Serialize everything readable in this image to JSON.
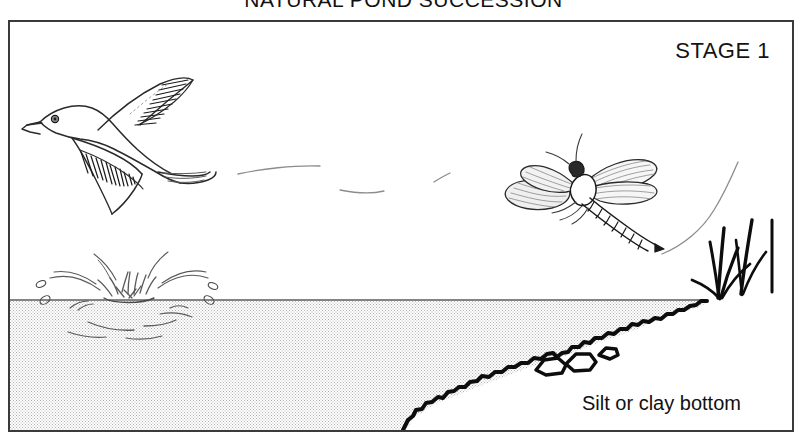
{
  "figure": {
    "title": "NATURAL POND  SUCCESSION",
    "stage_label": "STAGE 1",
    "bottom_label": "Silt or clay bottom"
  },
  "colors": {
    "frame_border": "#3a3a3a",
    "ink": "#111111",
    "line_gray": "#6d6d6d",
    "water_stipple": "#9a9a9a",
    "background": "#ffffff"
  },
  "elements": {
    "bird_name": "flying-bird",
    "dragonfly_name": "dragonfly",
    "splash_name": "water-splash",
    "reeds_name": "shore-reeds",
    "waterline_name": "water-surface-line",
    "sediment_name": "sloping-pond-bottom",
    "rocks_name": "bottom-rocks",
    "flight_trail_name": "bird-flight-trail",
    "dragonfly_trail_name": "dragonfly-flight-path"
  }
}
